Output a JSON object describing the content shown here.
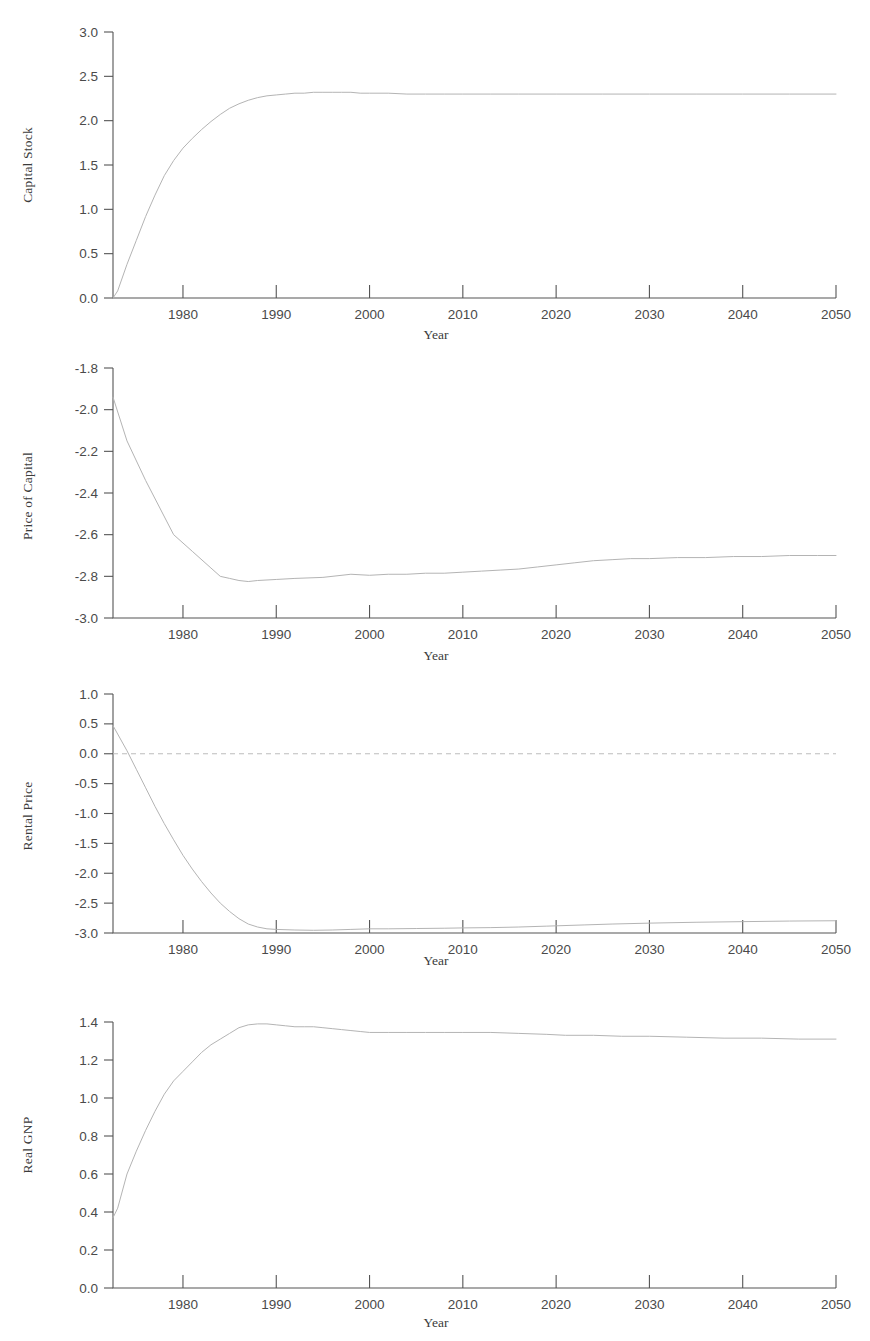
{
  "figure": {
    "background": "#ffffff",
    "line_color": "#b4b4b4",
    "axis_color": "#555555",
    "zero_line_color": "#bcbcbc",
    "panel_count": 4
  },
  "chart_data": [
    {
      "type": "line",
      "title": "",
      "xlabel": "Year",
      "ylabel": "Capital Stock",
      "xlim": [
        1972.5,
        2050
      ],
      "ylim": [
        0.0,
        3.0
      ],
      "grid": false,
      "legend": null,
      "xticks": [
        1980,
        1990,
        2000,
        2010,
        2020,
        2030,
        2040,
        2050
      ],
      "xticklabels": [
        "1980",
        "1990",
        "2000",
        "2010",
        "2020",
        "2030",
        "2040",
        "2050"
      ],
      "yticks": [
        0.0,
        0.5,
        1.0,
        1.5,
        2.0,
        2.5,
        3.0
      ],
      "yticklabels": [
        "0.0",
        "0.5",
        "1.0",
        "1.5",
        "2.0",
        "2.5",
        "3.0"
      ],
      "x": [
        1972.5,
        1973,
        1974,
        1975,
        1976,
        1977,
        1978,
        1979,
        1980,
        1981,
        1982,
        1983,
        1984,
        1985,
        1986,
        1987,
        1988,
        1989,
        1990,
        1991,
        1992,
        1993,
        1994,
        1995,
        1996,
        1997,
        1998,
        1999,
        2000,
        2002,
        2004,
        2006,
        2008,
        2010,
        2013,
        2016,
        2020,
        2025,
        2030,
        2035,
        2040,
        2045,
        2050
      ],
      "y": [
        0.0,
        0.08,
        0.38,
        0.65,
        0.92,
        1.16,
        1.38,
        1.55,
        1.69,
        1.8,
        1.9,
        1.99,
        2.07,
        2.14,
        2.19,
        2.23,
        2.26,
        2.28,
        2.29,
        2.3,
        2.31,
        2.31,
        2.32,
        2.32,
        2.32,
        2.32,
        2.32,
        2.31,
        2.31,
        2.31,
        2.3,
        2.3,
        2.3,
        2.3,
        2.3,
        2.3,
        2.3,
        2.3,
        2.3,
        2.3,
        2.3,
        2.3,
        2.3
      ]
    },
    {
      "type": "line",
      "title": "",
      "xlabel": "Year",
      "ylabel": "Price of Capital",
      "xlim": [
        1972.5,
        2050
      ],
      "ylim": [
        -3.0,
        -1.8
      ],
      "grid": false,
      "legend": null,
      "xticks": [
        1980,
        1990,
        2000,
        2010,
        2020,
        2030,
        2040,
        2050
      ],
      "xticklabels": [
        "1980",
        "1990",
        "2000",
        "2010",
        "2020",
        "2030",
        "2040",
        "2050"
      ],
      "yticks": [
        -3.0,
        -2.8,
        -2.6,
        -2.4,
        -2.2,
        -2.0,
        -1.8
      ],
      "yticklabels": [
        "-3.0",
        "-2.8",
        "-2.6",
        "-2.4",
        "-2.2",
        "-2.0",
        "-1.8"
      ],
      "x": [
        1972.5,
        1974,
        1976,
        1979,
        1981,
        1983,
        1984,
        1985,
        1986,
        1987,
        1988,
        1990,
        1992,
        1995,
        1998,
        2000,
        2002,
        2004,
        2006,
        2008,
        2010,
        2012,
        2014,
        2016,
        2018,
        2020,
        2022,
        2024,
        2026,
        2028,
        2030,
        2033,
        2036,
        2039,
        2042,
        2045,
        2048,
        2050
      ],
      "y": [
        -1.94,
        -2.15,
        -2.34,
        -2.6,
        -2.68,
        -2.76,
        -2.8,
        -2.81,
        -2.82,
        -2.825,
        -2.82,
        -2.815,
        -2.81,
        -2.805,
        -2.79,
        -2.795,
        -2.79,
        -2.79,
        -2.785,
        -2.785,
        -2.78,
        -2.775,
        -2.77,
        -2.765,
        -2.755,
        -2.745,
        -2.735,
        -2.725,
        -2.72,
        -2.715,
        -2.715,
        -2.71,
        -2.71,
        -2.705,
        -2.705,
        -2.7,
        -2.7,
        -2.7
      ]
    },
    {
      "type": "line",
      "title": "",
      "xlabel": "Year",
      "ylabel": "Rental Price",
      "xlim": [
        1972.5,
        2050
      ],
      "ylim": [
        -3.0,
        1.0
      ],
      "grid": false,
      "legend": null,
      "zero_line": 0.0,
      "xticks": [
        1980,
        1990,
        2000,
        2010,
        2020,
        2030,
        2040,
        2050
      ],
      "xticklabels": [
        "1980",
        "1990",
        "2000",
        "2010",
        "2020",
        "2030",
        "2040",
        "2050"
      ],
      "yticks": [
        -3.0,
        -2.5,
        -2.0,
        -1.5,
        -1.0,
        -0.5,
        0.0,
        0.5,
        1.0
      ],
      "yticklabels": [
        "-3.0",
        "-2.5",
        "-2.0",
        "-1.5",
        "-1.0",
        "-0.5",
        "0.0",
        "0.5",
        "1.0"
      ],
      "x": [
        1972.5,
        1973,
        1974,
        1975,
        1976,
        1977,
        1978,
        1979,
        1980,
        1981,
        1982,
        1983,
        1984,
        1985,
        1986,
        1987,
        1988,
        1989,
        1990,
        1992,
        1994,
        1996,
        1998,
        2000,
        2002,
        2005,
        2008,
        2010,
        2013,
        2016,
        2019,
        2020,
        2023,
        2026,
        2030,
        2035,
        2040,
        2045,
        2050
      ],
      "y": [
        0.47,
        0.33,
        0.05,
        -0.26,
        -0.57,
        -0.88,
        -1.17,
        -1.44,
        -1.7,
        -1.93,
        -2.14,
        -2.33,
        -2.5,
        -2.64,
        -2.76,
        -2.85,
        -2.9,
        -2.93,
        -2.94,
        -2.95,
        -2.955,
        -2.95,
        -2.94,
        -2.93,
        -2.93,
        -2.925,
        -2.92,
        -2.915,
        -2.91,
        -2.9,
        -2.885,
        -2.88,
        -2.865,
        -2.85,
        -2.835,
        -2.82,
        -2.81,
        -2.8,
        -2.795
      ]
    },
    {
      "type": "line",
      "title": "",
      "xlabel": "Year",
      "ylabel": "Real GNP",
      "xlim": [
        1972.5,
        2050
      ],
      "ylim": [
        0.0,
        1.4
      ],
      "grid": false,
      "legend": null,
      "xticks": [
        1980,
        1990,
        2000,
        2010,
        2020,
        2030,
        2040,
        2050
      ],
      "xticklabels": [
        "1980",
        "1990",
        "2000",
        "2010",
        "2020",
        "2030",
        "2040",
        "2050"
      ],
      "yticks": [
        0.0,
        0.2,
        0.4,
        0.6,
        0.8,
        1.0,
        1.2,
        1.4
      ],
      "yticklabels": [
        "0.0",
        "0.2",
        "0.4",
        "0.6",
        "0.8",
        "1.0",
        "1.2",
        "1.4"
      ],
      "x": [
        1972.5,
        1973,
        1974,
        1975,
        1976,
        1977,
        1978,
        1979,
        1980,
        1981,
        1982,
        1983,
        1984,
        1985,
        1986,
        1987,
        1988,
        1989,
        1990,
        1991,
        1992,
        1993,
        1994,
        1995,
        1996,
        1997,
        1998,
        1999,
        2000,
        2002,
        2004,
        2006,
        2008,
        2010,
        2013,
        2016,
        2019,
        2021,
        2024,
        2027,
        2030,
        2034,
        2038,
        2042,
        2046,
        2050
      ],
      "y": [
        0.37,
        0.42,
        0.6,
        0.72,
        0.83,
        0.93,
        1.02,
        1.09,
        1.14,
        1.19,
        1.24,
        1.28,
        1.31,
        1.34,
        1.37,
        1.385,
        1.39,
        1.39,
        1.385,
        1.38,
        1.375,
        1.375,
        1.375,
        1.37,
        1.365,
        1.36,
        1.355,
        1.35,
        1.345,
        1.345,
        1.345,
        1.345,
        1.345,
        1.345,
        1.345,
        1.34,
        1.335,
        1.33,
        1.33,
        1.325,
        1.325,
        1.32,
        1.315,
        1.315,
        1.31,
        1.31
      ]
    }
  ]
}
